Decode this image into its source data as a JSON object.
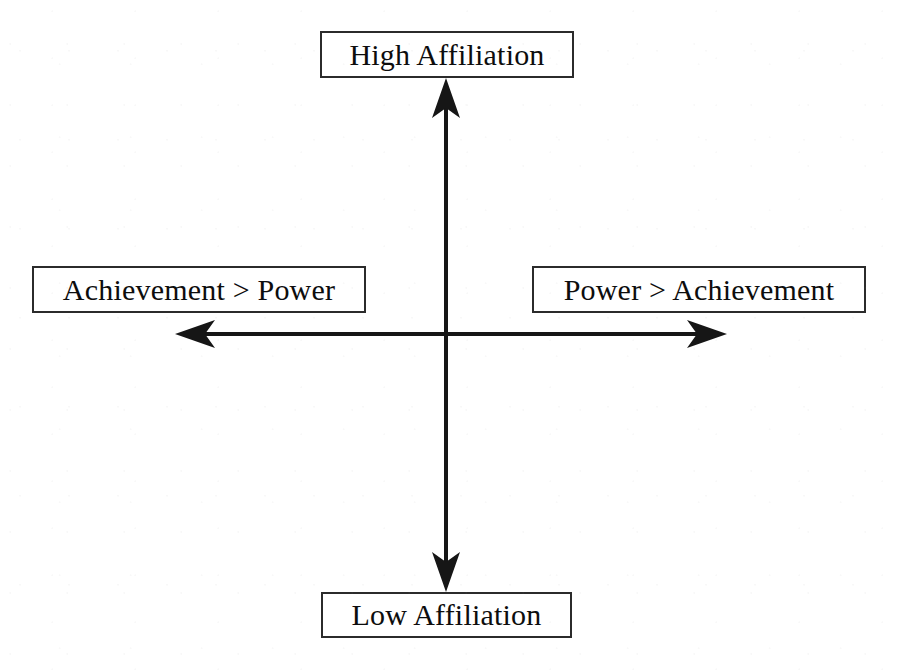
{
  "diagram": {
    "type": "two-axis quadrant diagram",
    "background_color": "#ffffff",
    "line_color": "#161616",
    "box_border_color": "#2b2b2b",
    "text_color": "#0d0d0d",
    "vertical_axis": {
      "name": "affiliation-axis",
      "top_label": "High Affiliation",
      "bottom_label": "Low Affiliation",
      "double_headed": true
    },
    "horizontal_axis": {
      "name": "power-achievement-axis",
      "left_label": "Achievement > Power",
      "right_label": "Power > Achievement",
      "double_headed": true
    },
    "labels": {
      "high_affiliation": "High Affiliation",
      "low_affiliation": "Low Affiliation",
      "achievement_over_power": "Achievement > Power",
      "power_over_achievement": "Power > Achievement"
    }
  }
}
